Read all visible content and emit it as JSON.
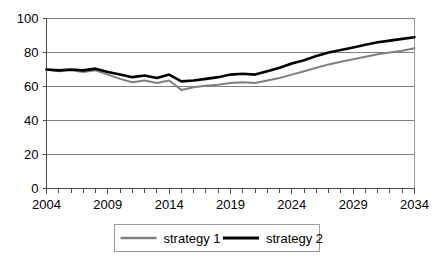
{
  "chart_data": {
    "type": "line",
    "title": "",
    "subtitle": "",
    "xlabel": "",
    "ylabel": "",
    "xlim": [
      2004,
      2034
    ],
    "ylim": [
      0,
      100
    ],
    "grid": true,
    "legend_position": "bottom",
    "y_ticks": [
      0,
      20,
      40,
      60,
      80,
      100
    ],
    "y_tick_labels": [
      "0",
      "20",
      "40",
      "60",
      "80",
      "100"
    ],
    "x_ticks": [
      2004,
      2009,
      2014,
      2019,
      2024,
      2029,
      2034
    ],
    "x_tick_labels": [
      "2004",
      "2009",
      "2014",
      "2019",
      "2024",
      "2029",
      "2034"
    ],
    "x_minor_tick_step": 1,
    "x": [
      2004,
      2005,
      2006,
      2007,
      2008,
      2009,
      2010,
      2011,
      2012,
      2013,
      2014,
      2015,
      2016,
      2017,
      2018,
      2019,
      2020,
      2021,
      2022,
      2023,
      2024,
      2025,
      2026,
      2027,
      2028,
      2029,
      2030,
      2031,
      2032,
      2033,
      2034
    ],
    "series": [
      {
        "name": "strategy 1",
        "color": "#808080",
        "width": 2.0,
        "values": [
          70,
          69,
          69.5,
          68.5,
          69.5,
          67,
          64.5,
          62.5,
          63.5,
          62,
          63.5,
          58,
          59.5,
          60.5,
          61,
          62,
          62.5,
          62,
          63.5,
          65,
          67,
          69,
          71,
          73,
          74.5,
          76,
          77.5,
          79,
          80,
          81,
          82.5
        ]
      },
      {
        "name": "strategy 2",
        "color": "#000000",
        "width": 2.6,
        "values": [
          70,
          69.5,
          70,
          69.5,
          70.5,
          68.5,
          67,
          65.5,
          66.5,
          65,
          67,
          63,
          63.5,
          64.5,
          65.5,
          67,
          67.5,
          67,
          69,
          71,
          73.5,
          75.5,
          78,
          80,
          81.5,
          83,
          84.5,
          86,
          87,
          88,
          89
        ]
      }
    ]
  },
  "legend": {
    "items": [
      {
        "label": "strategy 1"
      },
      {
        "label": "strategy 2"
      }
    ]
  }
}
